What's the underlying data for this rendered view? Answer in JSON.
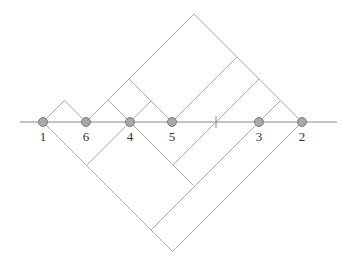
{
  "diagram": {
    "type": "arc-diagram",
    "axis": {
      "y": 122,
      "x_start": 20,
      "x_end": 337,
      "color": "#8a8a8a"
    },
    "tick": {
      "x": 216
    },
    "line_color": "#b0b0b0",
    "node_fill": "#a9a9a9",
    "node_stroke": "#7a7a7a",
    "nodes": [
      {
        "label": "1",
        "x": 43
      },
      {
        "label": "6",
        "x": 86
      },
      {
        "label": "4",
        "x": 130
      },
      {
        "label": "5",
        "x": 172
      },
      {
        "label": "3",
        "x": 259
      },
      {
        "label": "2",
        "x": 302
      }
    ],
    "upper_arcs": [
      {
        "from": 43,
        "to": 86
      },
      {
        "from": 86,
        "to": 130
      },
      {
        "from": 86,
        "to": 172
      },
      {
        "from": 130,
        "to": 172
      },
      {
        "from": 86,
        "to": 302
      },
      {
        "from": 172,
        "to": 302
      },
      {
        "from": 216,
        "to": 302
      },
      {
        "from": 259,
        "to": 302
      }
    ],
    "lower_arcs": [
      {
        "from": 43,
        "to": 130
      },
      {
        "from": 130,
        "to": 216
      },
      {
        "from": 130,
        "to": 259
      },
      {
        "from": 43,
        "to": 259
      },
      {
        "from": 43,
        "to": 302
      }
    ]
  }
}
